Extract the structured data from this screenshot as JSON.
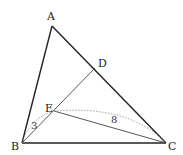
{
  "diagram": {
    "type": "geometry-triangle",
    "points": {
      "A": {
        "label": "A",
        "x": 52,
        "y": 26
      },
      "B": {
        "label": "B",
        "x": 22,
        "y": 143
      },
      "C": {
        "label": "C",
        "x": 166,
        "y": 143
      },
      "D": {
        "label": "D",
        "x": 95,
        "y": 68
      },
      "E": {
        "label": "E",
        "x": 54,
        "y": 111
      }
    },
    "segments": [
      "AB",
      "BC",
      "CA",
      "BD",
      "EC"
    ],
    "measures": {
      "BE": "3",
      "EC": "8"
    },
    "colors": {
      "stroke": "#222222",
      "thin_stroke": "#444444",
      "dotted": "#888888"
    }
  }
}
